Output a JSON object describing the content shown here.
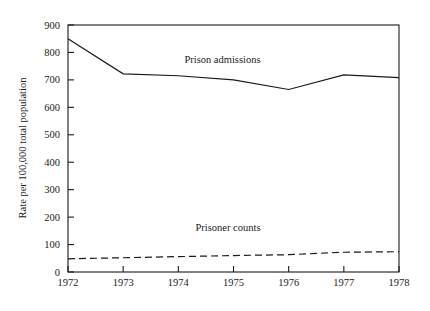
{
  "chart_data": {
    "type": "line",
    "title": "",
    "xlabel": "",
    "ylabel": "Rate per 100,000 total population",
    "x": [
      1972,
      1973,
      1974,
      1975,
      1976,
      1977,
      1978
    ],
    "xtick_labels": [
      "1972",
      "1973",
      "1974",
      "1975",
      "1976",
      "1977",
      "1978"
    ],
    "ytick_labels": [
      "0",
      "100",
      "200",
      "300",
      "400",
      "500",
      "600",
      "700",
      "800",
      "900"
    ],
    "ylim": [
      0,
      900
    ],
    "xlim": [
      1972,
      1978
    ],
    "grid": false,
    "legend_position": "inline-annotations",
    "series": [
      {
        "name": "Prison admissions",
        "style": "solid",
        "color": "#1a1a1a",
        "values": [
          850,
          722,
          715,
          700,
          665,
          718,
          708
        ],
        "annotation": "Prison admissions"
      },
      {
        "name": "Prisoner counts",
        "style": "dashed",
        "color": "#1a1a1a",
        "values": [
          48,
          52,
          56,
          60,
          63,
          72,
          74
        ],
        "annotation": "Prisoner counts"
      }
    ],
    "annotations": [
      {
        "text": "Prison admissions",
        "x": 1974.8,
        "y": 760
      },
      {
        "text": "Prisoner counts",
        "x": 1974.9,
        "y": 150
      }
    ]
  }
}
